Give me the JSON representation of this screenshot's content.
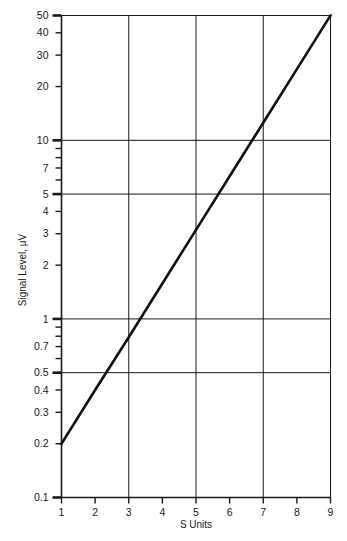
{
  "chart_data": {
    "type": "line",
    "title": "",
    "xlabel": "S Units",
    "ylabel": "Signal Level, μV",
    "xscale": "linear",
    "yscale": "log",
    "xlim": [
      1,
      9
    ],
    "ylim": [
      0.1,
      50
    ],
    "grid": true,
    "legend": false,
    "x_ticks": [
      1,
      2,
      3,
      4,
      5,
      6,
      7,
      8,
      9
    ],
    "x_tick_labels": [
      "1",
      "2",
      "3",
      "4",
      "5",
      "6",
      "7",
      "8",
      "9"
    ],
    "x_gridlines": [
      1,
      3,
      5,
      7,
      9
    ],
    "y_ticks": [
      0.1,
      0.2,
      0.3,
      0.4,
      0.5,
      0.6,
      0.7,
      0.8,
      0.9,
      1,
      2,
      3,
      4,
      5,
      6,
      7,
      8,
      9,
      10,
      20,
      30,
      40,
      50
    ],
    "y_tick_labels": [
      {
        "value": 50,
        "label": "50"
      },
      {
        "value": 40,
        "label": "40"
      },
      {
        "value": 30,
        "label": "30"
      },
      {
        "value": 20,
        "label": "20"
      },
      {
        "value": 10,
        "label": "10"
      },
      {
        "value": 7,
        "label": "7"
      },
      {
        "value": 5,
        "label": "5"
      },
      {
        "value": 4,
        "label": "4"
      },
      {
        "value": 3,
        "label": "3"
      },
      {
        "value": 2,
        "label": "2"
      },
      {
        "value": 1,
        "label": "1"
      },
      {
        "value": 0.7,
        "label": "0.7"
      },
      {
        "value": 0.5,
        "label": "0.5"
      },
      {
        "value": 0.4,
        "label": "0.4"
      },
      {
        "value": 0.3,
        "label": "0.3"
      },
      {
        "value": 0.2,
        "label": "0.2"
      },
      {
        "value": 0.1,
        "label": "0.1"
      }
    ],
    "y_gridlines": [
      0.1,
      0.5,
      1,
      5,
      10,
      50
    ],
    "series": [
      {
        "name": "Signal level vs S unit",
        "color": "#111111",
        "x": [
          1,
          2,
          3,
          4,
          5,
          6,
          7,
          8,
          9
        ],
        "values": [
          0.2,
          0.4,
          0.79,
          1.58,
          3.15,
          6.29,
          12.55,
          25.05,
          50.0
        ]
      }
    ],
    "annotations": []
  }
}
